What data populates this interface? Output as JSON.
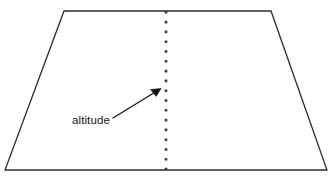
{
  "figure": {
    "name": "trapezoid-altitude-diagram",
    "type": "geometry-diagram",
    "canvas": {
      "width": 332,
      "height": 178,
      "background": "#ffffff"
    },
    "shape": {
      "name": "trapezoid",
      "stroke_color": "#2b2b2b",
      "fill_color": "#ffffff",
      "vertices": [
        {
          "label": "top-left",
          "x": 64,
          "y": 11
        },
        {
          "label": "top-right",
          "x": 271,
          "y": 11
        },
        {
          "label": "bottom-right",
          "x": 327,
          "y": 170
        },
        {
          "label": "bottom-left",
          "x": 5,
          "y": 170
        }
      ]
    },
    "altitude": {
      "name": "altitude-segment",
      "style": "dotted",
      "color": "#3a3a3a",
      "x": 166,
      "y_top": 11,
      "y_bottom": 170
    },
    "annotation": {
      "label": "altitude",
      "text_color": "#141414",
      "leader": {
        "color": "#111111",
        "start_x": 113,
        "start_y": 118,
        "end_x": 161,
        "end_y": 89
      }
    }
  }
}
